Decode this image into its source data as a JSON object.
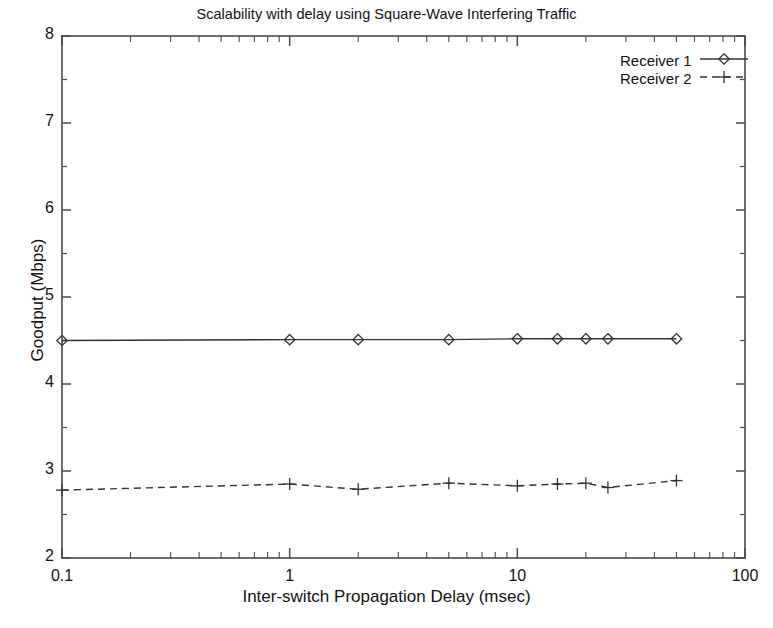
{
  "chart_data": {
    "type": "line",
    "title": "Scalability with delay using Square-Wave Interfering Traffic",
    "xlabel": "Inter-switch Propagation Delay (msec)",
    "ylabel": "Goodput (Mbps)",
    "xscale": "log",
    "yscale": "linear",
    "xlim": [
      0.1,
      100
    ],
    "ylim": [
      2,
      8
    ],
    "grid": false,
    "legend_position": "top-right",
    "xticks": [
      {
        "value": 0.1,
        "label": "0.1"
      },
      {
        "value": 1,
        "label": "1"
      },
      {
        "value": 10,
        "label": "10"
      },
      {
        "value": 100,
        "label": "100"
      }
    ],
    "yticks": [
      {
        "value": 2,
        "label": "2"
      },
      {
        "value": 3,
        "label": "3"
      },
      {
        "value": 4,
        "label": "4"
      },
      {
        "value": 5,
        "label": "5"
      },
      {
        "value": 6,
        "label": "6"
      },
      {
        "value": 7,
        "label": "7"
      },
      {
        "value": 8,
        "label": "8"
      }
    ],
    "series": [
      {
        "name": "Receiver 1",
        "linestyle": "solid",
        "marker": "diamond",
        "color": "#333333",
        "x": [
          0.1,
          1,
          2,
          5,
          10,
          15,
          20,
          25,
          50
        ],
        "values": [
          4.5,
          4.51,
          4.51,
          4.51,
          4.52,
          4.52,
          4.52,
          4.52,
          4.52
        ]
      },
      {
        "name": "Receiver 2",
        "linestyle": "dashed",
        "marker": "plus",
        "color": "#333333",
        "x": [
          0.1,
          1,
          2,
          5,
          10,
          15,
          20,
          25,
          50
        ],
        "values": [
          2.78,
          2.85,
          2.79,
          2.86,
          2.83,
          2.85,
          2.86,
          2.81,
          2.89
        ]
      }
    ]
  },
  "legend": {
    "entries": [
      {
        "label": "Receiver 1"
      },
      {
        "label": "Receiver 2"
      }
    ]
  }
}
